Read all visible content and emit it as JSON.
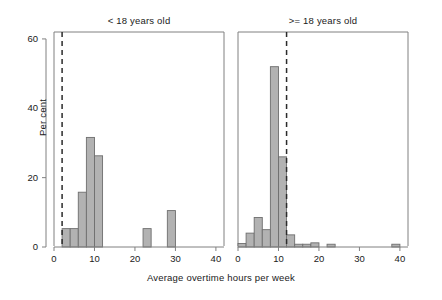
{
  "chart_data": {
    "type": "bar",
    "title": "",
    "subtitle": "",
    "xlabel": "Average overtime hours per week",
    "ylabel": "Per cent",
    "xlim": [
      0,
      42
    ],
    "ylim": [
      0,
      62
    ],
    "xticks": [
      0,
      10,
      20,
      30,
      40
    ],
    "yticks": [
      0,
      20,
      40,
      60
    ],
    "grid": false,
    "legend": null,
    "bin_width": 2,
    "panels": [
      {
        "id": "under-18",
        "title": "< 18 years old",
        "annotation_line": {
          "type": "vertical-dashed",
          "x": 2
        },
        "bins": [
          {
            "x0": 2,
            "x1": 4,
            "value": 5.3
          },
          {
            "x0": 4,
            "x1": 6,
            "value": 5.3
          },
          {
            "x0": 6,
            "x1": 8,
            "value": 15.8
          },
          {
            "x0": 8,
            "x1": 10,
            "value": 31.6
          },
          {
            "x0": 10,
            "x1": 12,
            "value": 26.3
          },
          {
            "x0": 22,
            "x1": 24,
            "value": 5.3
          },
          {
            "x0": 28,
            "x1": 30,
            "value": 10.5
          }
        ]
      },
      {
        "id": "18-and-over",
        "title": ">= 18 years old",
        "annotation_line": {
          "type": "vertical-dashed",
          "x": 12
        },
        "bins": [
          {
            "x0": 0,
            "x1": 2,
            "value": 1.0
          },
          {
            "x0": 2,
            "x1": 4,
            "value": 4.0
          },
          {
            "x0": 4,
            "x1": 6,
            "value": 8.5
          },
          {
            "x0": 6,
            "x1": 8,
            "value": 5.0
          },
          {
            "x0": 8,
            "x1": 10,
            "value": 52.0
          },
          {
            "x0": 10,
            "x1": 12,
            "value": 26.0
          },
          {
            "x0": 12,
            "x1": 14,
            "value": 3.5
          },
          {
            "x0": 14,
            "x1": 16,
            "value": 0.8
          },
          {
            "x0": 16,
            "x1": 18,
            "value": 0.8
          },
          {
            "x0": 18,
            "x1": 20,
            "value": 1.2
          },
          {
            "x0": 22,
            "x1": 24,
            "value": 0.8
          },
          {
            "x0": 38,
            "x1": 40,
            "value": 0.8
          }
        ]
      }
    ],
    "colors": {
      "bar_fill": "#b2b2b2",
      "bar_stroke": "#6e6e6e",
      "axis": "#808080",
      "dashed_line": "#2b2b2b",
      "text": "#1a1a1a",
      "background": "#ffffff"
    }
  }
}
